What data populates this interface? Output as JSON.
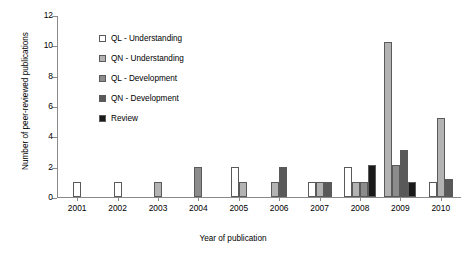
{
  "chart_data": {
    "type": "bar",
    "title": "",
    "xlabel": "Year of publication",
    "ylabel": "Number of peer-reviewed publications",
    "ylim": [
      0,
      12
    ],
    "ytick_step": 2,
    "yticks": [
      0,
      2,
      4,
      6,
      8,
      10,
      12
    ],
    "grid": false,
    "legend_position": "upper-left-inside",
    "categories": [
      "2001",
      "2002",
      "2003",
      "2004",
      "2005",
      "2006",
      "2007",
      "2008",
      "2009",
      "2010"
    ],
    "series": [
      {
        "name": "QL - Understanding",
        "color": "#ffffff",
        "values": [
          1,
          1,
          0,
          0,
          2,
          0,
          1,
          2,
          0,
          1
        ]
      },
      {
        "name": "QN - Understanding",
        "color": "#b3b3b3",
        "values": [
          0,
          0,
          1,
          0,
          1,
          1,
          1,
          1,
          10.2,
          5.2
        ]
      },
      {
        "name": "QL - Development",
        "color": "#8c8c8c",
        "values": [
          0,
          0,
          0,
          2,
          0,
          0,
          0,
          1,
          2.1,
          0
        ]
      },
      {
        "name": "QN - Development",
        "color": "#595959",
        "values": [
          0,
          0,
          0,
          0,
          0,
          2,
          1,
          0,
          3.1,
          1.2
        ]
      },
      {
        "name": "Review",
        "color": "#1a1a1a",
        "values": [
          0,
          0,
          0,
          0,
          0,
          0,
          0,
          2.1,
          1,
          0
        ]
      }
    ]
  },
  "legend": {
    "items": [
      {
        "label": "QL - Understanding"
      },
      {
        "label": "QN - Understanding"
      },
      {
        "label": "QL - Development"
      },
      {
        "label": "QN - Development"
      },
      {
        "label": "Review"
      }
    ]
  }
}
